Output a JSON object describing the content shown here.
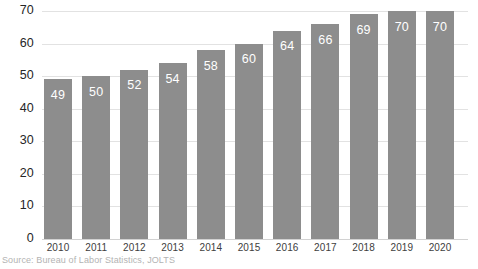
{
  "chart_data": {
    "type": "bar",
    "title": "",
    "xlabel": "",
    "ylabel": "",
    "categories": [
      "2010",
      "2011",
      "2012",
      "2013",
      "2014",
      "2015",
      "2016",
      "2017",
      "2018",
      "2019",
      "2020"
    ],
    "values": [
      49,
      50,
      52,
      54,
      58,
      60,
      64,
      66,
      69,
      70,
      70
    ],
    "data_labels": [
      "49",
      "50",
      "52",
      "54",
      "58",
      "60",
      "64",
      "66",
      "69",
      "70",
      "70"
    ],
    "ylim": [
      0,
      70
    ],
    "yticks": [
      0,
      10,
      20,
      30,
      40,
      50,
      60,
      70
    ],
    "ytick_labels": [
      "0",
      "10",
      "20",
      "30",
      "40",
      "50",
      "60",
      "70"
    ],
    "grid": true,
    "legend": false,
    "bar_color": "#8d8d8d",
    "gridline_color": "#e2e2e2",
    "data_label_color": "#ffffff",
    "axis_label_color": "#262626",
    "source_color": "#b3b3b3",
    "background": "#ffffff"
  },
  "source": {
    "text": "Source: Bureau of Labor Statistics, JOLTS"
  }
}
